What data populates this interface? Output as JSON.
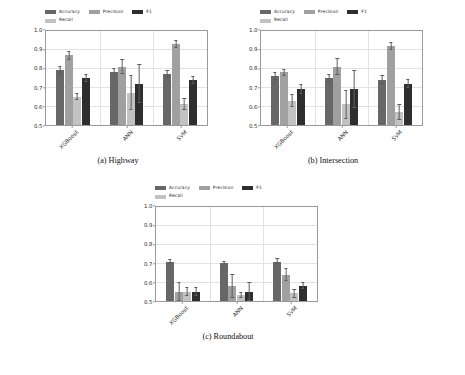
{
  "figure": {
    "subplot_captions": [
      "(a) Highway",
      "(b) Intersection",
      "(c) Roundabout"
    ]
  },
  "legend": {
    "entries": [
      {
        "label": "Accuracy",
        "color": "#676767"
      },
      {
        "label": "Precision",
        "color": "#a0a0a0"
      },
      {
        "label": "F1",
        "color": "#2e2e2e"
      },
      {
        "label": "Recall",
        "color": "#c2c2c2"
      }
    ]
  },
  "axis": {
    "yticks": [
      "0.5",
      "0.6",
      "0.7",
      "0.8",
      "0.9",
      "1.0"
    ],
    "xticks": [
      "XGBoost",
      "ANN",
      "SVM"
    ]
  },
  "chart_data": [
    {
      "type": "bar",
      "title": "(a) Highway",
      "xlabel": "",
      "ylabel": "",
      "ylim": [
        0.5,
        1.0
      ],
      "grid": true,
      "legend_position": "upper-left",
      "categories": [
        "XGBoost",
        "ANN",
        "SVM"
      ],
      "series": [
        {
          "name": "Accuracy",
          "values": [
            0.79,
            0.78,
            0.77
          ],
          "errors": [
            0.018,
            0.018,
            0.02
          ]
        },
        {
          "name": "Precision",
          "values": [
            0.87,
            0.81,
            0.93
          ],
          "errors": [
            0.022,
            0.038,
            0.018
          ]
        },
        {
          "name": "Recall",
          "values": [
            0.65,
            0.67,
            0.61
          ],
          "errors": [
            0.015,
            0.09,
            0.03
          ]
        },
        {
          "name": "F1",
          "values": [
            0.75,
            0.72,
            0.74
          ],
          "errors": [
            0.02,
            0.1,
            0.018
          ]
        }
      ]
    },
    {
      "type": "bar",
      "title": "(b) Intersection",
      "xlabel": "",
      "ylabel": "",
      "ylim": [
        0.5,
        1.0
      ],
      "grid": true,
      "legend_position": "upper-left",
      "categories": [
        "XGBoost",
        "ANN",
        "SVM"
      ],
      "series": [
        {
          "name": "Accuracy",
          "values": [
            0.76,
            0.75,
            0.74
          ],
          "errors": [
            0.018,
            0.018,
            0.022
          ]
        },
        {
          "name": "Precision",
          "values": [
            0.78,
            0.81,
            0.92
          ],
          "errors": [
            0.016,
            0.042,
            0.018
          ]
        },
        {
          "name": "Recall",
          "values": [
            0.63,
            0.61,
            0.57
          ],
          "errors": [
            0.03,
            0.075,
            0.04
          ]
        },
        {
          "name": "F1",
          "values": [
            0.69,
            0.69,
            0.72
          ],
          "errors": [
            0.022,
            0.1,
            0.022
          ]
        }
      ]
    },
    {
      "type": "bar",
      "title": "(c) Roundabout",
      "xlabel": "",
      "ylabel": "",
      "ylim": [
        0.5,
        1.0
      ],
      "grid": true,
      "legend_position": "upper-left",
      "categories": [
        "XGBoost",
        "ANN",
        "SVM"
      ],
      "series": [
        {
          "name": "Accuracy",
          "values": [
            0.71,
            0.7,
            0.71
          ],
          "errors": [
            0.012,
            0.008,
            0.014
          ]
        },
        {
          "name": "Precision",
          "values": [
            0.55,
            0.58,
            0.64
          ],
          "errors": [
            0.05,
            0.06,
            0.03
          ]
        },
        {
          "name": "Recall",
          "values": [
            0.55,
            0.53,
            0.54
          ],
          "errors": [
            0.022,
            0.012,
            0.02
          ]
        },
        {
          "name": "F1",
          "values": [
            0.55,
            0.55,
            0.58
          ],
          "errors": [
            0.022,
            0.05,
            0.015
          ]
        }
      ]
    }
  ]
}
